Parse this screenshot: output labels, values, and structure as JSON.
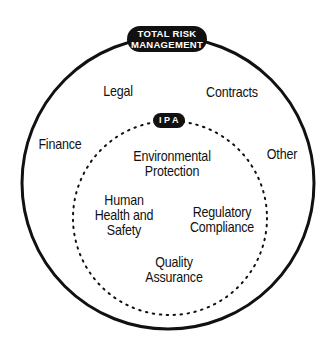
{
  "diagram": {
    "outer": {
      "label_line1": "TOTAL RISK",
      "label_line2": "MANAGEMENT",
      "items": {
        "legal": "Legal",
        "contracts": "Contracts",
        "finance": "Finance",
        "other": "Other"
      }
    },
    "inner": {
      "label": "IPA",
      "items": {
        "env_line1": "Environmental",
        "env_line2": "Protection",
        "hhs_line1": "Human",
        "hhs_line2": "Health and",
        "hhs_line3": "Safety",
        "reg_line1": "Regulatory",
        "reg_line2": "Compliance",
        "qa_line1": "Quality",
        "qa_line2": "Assurance"
      }
    },
    "colors": {
      "ink": "#111111",
      "background": "#ffffff"
    }
  }
}
